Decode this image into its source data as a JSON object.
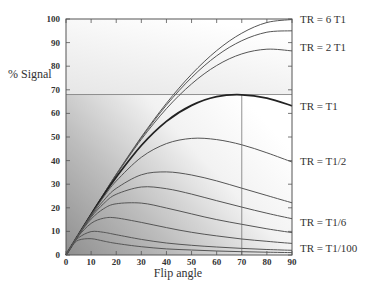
{
  "chart_data": {
    "type": "line",
    "title": "",
    "xlabel": "Flip angle",
    "ylabel": "% Signal",
    "xlim": [
      0,
      90
    ],
    "ylim": [
      0,
      100
    ],
    "x_ticks": [
      0,
      10,
      20,
      30,
      40,
      50,
      60,
      70,
      80,
      90
    ],
    "y_ticks": [
      0,
      10,
      20,
      30,
      40,
      50,
      60,
      70,
      80,
      90,
      100
    ],
    "grid": false,
    "legend_position": "right, inline labels at curve ends",
    "x": [
      0,
      2.5,
      5,
      10,
      15,
      20,
      30,
      40,
      50,
      60,
      70,
      80,
      90
    ],
    "series": [
      {
        "name": "TR = 6 T1",
        "label": "TR = 6 T1",
        "bold": false,
        "values": [
          0,
          4.36,
          8.7,
          17.4,
          25.9,
          34.2,
          50.0,
          64.3,
          76.6,
          86.6,
          94.0,
          98.5,
          99.8
        ]
      },
      {
        "name": "TR = 3 T1",
        "label": "",
        "bold": false,
        "values": [
          0,
          4.36,
          8.7,
          17.3,
          25.8,
          34.1,
          49.6,
          63.5,
          75.2,
          84.4,
          90.8,
          94.4,
          95.0
        ]
      },
      {
        "name": "TR = 2 T1",
        "label": "TR = 2 T1",
        "bold": false,
        "values": [
          0,
          4.36,
          8.7,
          17.3,
          25.7,
          33.9,
          49.0,
          62.0,
          72.5,
          80.3,
          85.2,
          87.2,
          86.5
        ]
      },
      {
        "name": "TR = T1",
        "label": "TR = T1",
        "bold": true,
        "values": [
          0,
          4.35,
          8.7,
          17.2,
          25.4,
          33.0,
          46.4,
          56.6,
          63.4,
          67.1,
          67.9,
          66.5,
          63.2
        ]
      },
      {
        "name": "TR = T1/2",
        "label": "TR = T1/2",
        "bold": false,
        "values": [
          0,
          4.35,
          8.67,
          17.0,
          24.6,
          31.3,
          41.4,
          47.2,
          49.4,
          48.9,
          46.7,
          43.3,
          39.4
        ]
      },
      {
        "name": "TR = T1/4",
        "label": "",
        "bold": false,
        "values": [
          0,
          4.34,
          8.6,
          16.5,
          23.1,
          28.2,
          34.0,
          35.2,
          33.9,
          31.4,
          28.3,
          25.2,
          22.1
        ]
      },
      {
        "name": "TR = T1/6",
        "label": "TR = T1/6",
        "bold": false,
        "values": [
          0,
          4.33,
          8.54,
          16.0,
          21.8,
          25.7,
          28.8,
          28.1,
          25.8,
          23.0,
          20.3,
          17.7,
          15.4
        ]
      },
      {
        "name": "TR = T1/10",
        "label": "",
        "bold": false,
        "values": [
          0,
          4.32,
          8.42,
          15.2,
          19.6,
          21.7,
          22.0,
          19.9,
          17.4,
          15.0,
          13.0,
          11.1,
          9.5
        ]
      },
      {
        "name": "TR = T1/20",
        "label": "",
        "bold": false,
        "values": [
          0,
          4.28,
          8.12,
          13.4,
          15.6,
          15.7,
          13.8,
          11.6,
          9.6,
          8.1,
          6.8,
          5.8,
          4.9
        ]
      },
      {
        "name": "TR = T1/50",
        "label": "",
        "bold": false,
        "values": [
          0,
          4.16,
          7.35,
          9.9,
          9.6,
          8.6,
          6.6,
          5.1,
          4.1,
          3.4,
          2.8,
          2.35,
          1.98
        ]
      },
      {
        "name": "TR = T1/100",
        "label": "TR = T1/100",
        "bold": false,
        "values": [
          0,
          3.99,
          6.33,
          6.9,
          5.9,
          4.9,
          3.5,
          2.6,
          2.1,
          1.7,
          1.4,
          1.2,
          1.0
        ]
      }
    ],
    "annotations": [
      {
        "type": "hline",
        "y": 68,
        "x_from": 0,
        "x_to": 90,
        "note": "max signal for TR = T1"
      },
      {
        "type": "vline",
        "x": 70,
        "y_from": 0,
        "y_to": 68,
        "note": "Ernst angle for TR = T1"
      }
    ],
    "label_positions_y": {
      "TR = 6 T1": 100,
      "TR = 2 T1": 88,
      "TR = T1": 63,
      "TR = T1/2": 40,
      "TR = T1/6": 14,
      "TR = T1/100": 3
    }
  },
  "colors": {
    "axis": "#555555",
    "curve": "#555555",
    "curve_bold": "#222222",
    "gradient_dark": "#9a9a9a",
    "gradient_light": "#ffffff"
  }
}
